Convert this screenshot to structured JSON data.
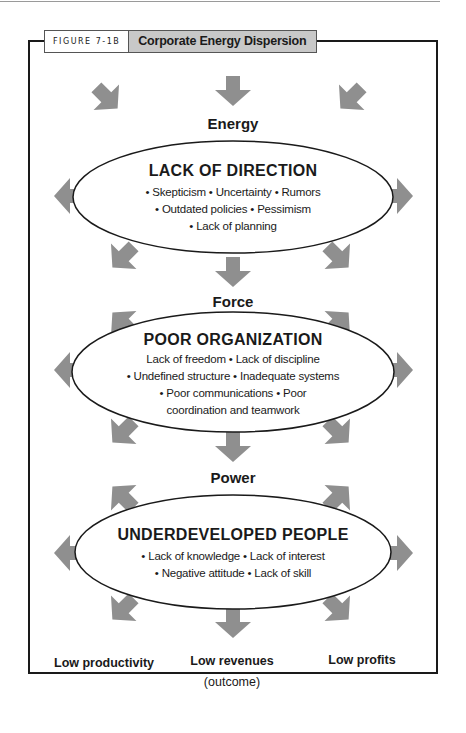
{
  "figure": {
    "label": "FIGURE 7-1B",
    "title": "Corporate Energy Dispersion"
  },
  "colors": {
    "arrow": "#8f8f8f",
    "caption_title_bg": "#c8c8c8",
    "frame": "#1a1a1a",
    "ellipse_stroke": "#1a1a1a"
  },
  "stages": [
    {
      "label": "Energy",
      "ellipse": {
        "title": "LACK OF DIRECTION",
        "lines": [
          "• Skepticism • Uncertainty • Rumors",
          "• Outdated policies • Pessimism",
          "• Lack of planning"
        ]
      }
    },
    {
      "label": "Force",
      "ellipse": {
        "title": "POOR ORGANIZATION",
        "lines": [
          "Lack of freedom • Lack of discipline",
          "• Undefined structure • Inadequate systems",
          "• Poor communications • Poor",
          "coordination and teamwork"
        ]
      }
    },
    {
      "label": "Power",
      "ellipse": {
        "title": "UNDERDEVELOPED PEOPLE",
        "lines": [
          "• Lack of knowledge • Lack of interest",
          "• Negative attitude • Lack of skill"
        ]
      }
    }
  ],
  "outcomes": {
    "items": [
      "Low productivity",
      "Low revenues",
      "Low profits"
    ],
    "note": "(outcome)"
  },
  "arrows": [
    {
      "name": "arrow-down-top",
      "x": 233,
      "y": 91,
      "dir": "down"
    },
    {
      "name": "arrow-in-top-left",
      "x": 107,
      "y": 98,
      "dir": "down-right"
    },
    {
      "name": "arrow-in-top-right",
      "x": 351,
      "y": 98,
      "dir": "down-left"
    },
    {
      "name": "arrow-left-ellipse-1",
      "x": 69,
      "y": 196,
      "dir": "left"
    },
    {
      "name": "arrow-right-ellipse-1",
      "x": 398,
      "y": 196,
      "dir": "right"
    },
    {
      "name": "arrow-out-bottom-left-1",
      "x": 123,
      "y": 257,
      "dir": "down-left"
    },
    {
      "name": "arrow-out-bottom-right-1",
      "x": 338,
      "y": 257,
      "dir": "down-right"
    },
    {
      "name": "arrow-down-1",
      "x": 233,
      "y": 272,
      "dir": "down"
    },
    {
      "name": "arrow-out-top-left-2",
      "x": 123,
      "y": 323,
      "dir": "up-left"
    },
    {
      "name": "arrow-out-top-right-2",
      "x": 338,
      "y": 323,
      "dir": "up-right"
    },
    {
      "name": "arrow-left-ellipse-2",
      "x": 69,
      "y": 370,
      "dir": "left"
    },
    {
      "name": "arrow-right-ellipse-2",
      "x": 398,
      "y": 370,
      "dir": "right"
    },
    {
      "name": "arrow-out-bottom-left-2",
      "x": 123,
      "y": 432,
      "dir": "down-left"
    },
    {
      "name": "arrow-out-bottom-right-2",
      "x": 338,
      "y": 432,
      "dir": "down-right"
    },
    {
      "name": "arrow-down-2",
      "x": 233,
      "y": 447,
      "dir": "down"
    },
    {
      "name": "arrow-out-top-left-3",
      "x": 123,
      "y": 497,
      "dir": "up-left"
    },
    {
      "name": "arrow-out-top-right-3",
      "x": 338,
      "y": 497,
      "dir": "up-right"
    },
    {
      "name": "arrow-left-ellipse-3",
      "x": 69,
      "y": 553,
      "dir": "left"
    },
    {
      "name": "arrow-right-ellipse-3",
      "x": 398,
      "y": 553,
      "dir": "right"
    },
    {
      "name": "arrow-out-bottom-left-3",
      "x": 123,
      "y": 609,
      "dir": "down-left"
    },
    {
      "name": "arrow-out-bottom-right-3",
      "x": 338,
      "y": 609,
      "dir": "down-right"
    },
    {
      "name": "arrow-down-3",
      "x": 233,
      "y": 623,
      "dir": "down"
    }
  ]
}
